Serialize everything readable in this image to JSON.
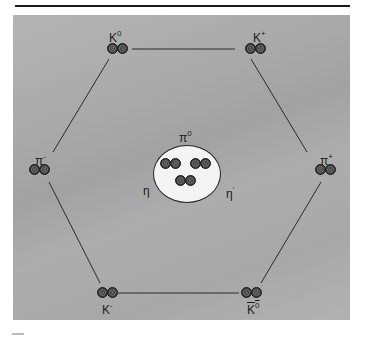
{
  "diagram": {
    "shape": "hexagon",
    "background_color": "#aaaaaa",
    "line_color": "#2a2a2a",
    "nodes": [
      {
        "id": "K0",
        "label": "K",
        "superscript": "0",
        "bar": false,
        "quarks": [
          "d",
          "s"
        ]
      },
      {
        "id": "Kplus",
        "label": "K",
        "superscript": "+",
        "bar": false,
        "quarks": [
          "s",
          "u"
        ]
      },
      {
        "id": "piminus",
        "label": "π",
        "superscript": "-",
        "bar": false,
        "quarks": [
          "u",
          "d"
        ]
      },
      {
        "id": "piplus",
        "label": "π",
        "superscript": "+",
        "bar": false,
        "quarks": [
          "d",
          "u"
        ]
      },
      {
        "id": "Kminus",
        "label": "K",
        "superscript": "-",
        "bar": false,
        "quarks": [
          "u",
          "s"
        ]
      },
      {
        "id": "K0bar",
        "label": "K",
        "superscript": "0",
        "bar": true,
        "quarks": [
          "s",
          "d"
        ]
      }
    ],
    "center": {
      "labels": {
        "top": "π",
        "top_sup": "0",
        "left": "η",
        "right": "η",
        "right_sup": "'"
      },
      "quark_pairs": [
        [
          "d",
          "d"
        ],
        [
          "u",
          "u"
        ],
        [
          "s",
          "s"
        ]
      ]
    },
    "edges": [
      [
        "K0",
        "Kplus"
      ],
      [
        "Kplus",
        "piplus"
      ],
      [
        "piplus",
        "K0bar"
      ],
      [
        "K0bar",
        "Kminus"
      ],
      [
        "Kminus",
        "piminus"
      ],
      [
        "piminus",
        "K0"
      ]
    ]
  }
}
